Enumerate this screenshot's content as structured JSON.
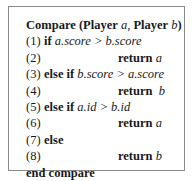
{
  "algorithm": {
    "header": {
      "name": "Compare",
      "open": " (",
      "type1": "Player",
      "arg1": "a",
      "sep": ", ",
      "type2": "Player",
      "arg2": "b",
      "close": ")"
    },
    "lines": [
      {
        "num": "(1)",
        "kw": "if",
        "expr": "a.score > b.score"
      },
      {
        "num": "(2)",
        "kw": "return",
        "expr": "a"
      },
      {
        "num": "(3)",
        "kw": "else if",
        "expr": "b.score > a.score"
      },
      {
        "num": "(4)",
        "kw": "return",
        "expr": "b"
      },
      {
        "num": "(5)",
        "kw": "else if",
        "expr": "a.id > b.id"
      },
      {
        "num": "(6)",
        "kw": "return",
        "expr": "a"
      },
      {
        "num": "(7)",
        "kw": "else",
        "expr": ""
      },
      {
        "num": "(8)",
        "kw": "return",
        "expr": "b"
      }
    ],
    "footer": "end compare"
  }
}
